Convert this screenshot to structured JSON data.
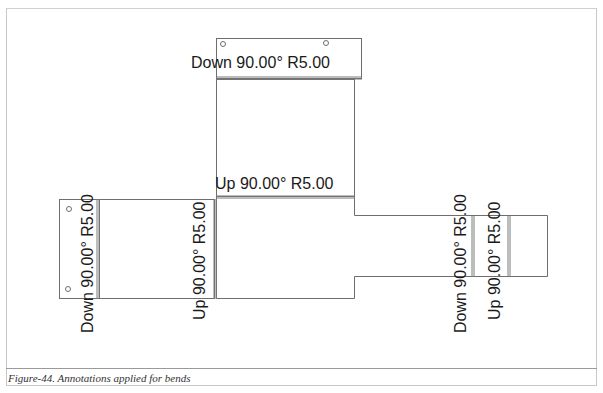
{
  "figure": {
    "caption": "Figure-44. Annotations applied for bends"
  },
  "annotations": {
    "top_bend": "Down 90.00° R5.00",
    "center_bend": "Up 90.00° R5.00",
    "left_flap_bend": "Down 90.00° R5.00",
    "left_panel_bend": "Up 90.00° R5.00",
    "right_bend_1": "Down 90.00° R5.00",
    "right_bend_2": "Up 90.00° R5.00"
  },
  "colors": {
    "outline": "#6e6e6e",
    "bend_line": "#7a7a7a",
    "frame": "#c8c8c8",
    "text": "#1a1a1a"
  }
}
